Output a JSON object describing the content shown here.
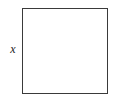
{
  "figure": {
    "kind": "geometry-diagram",
    "shape_name": "square",
    "background_color": "#ffffff",
    "stroke_color": "#3a3a3a",
    "fill_color": "#ffffff",
    "labels": {
      "side_label": "x"
    }
  }
}
